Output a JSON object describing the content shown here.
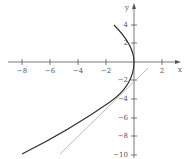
{
  "figure": {
    "x_axis_label": "x",
    "y_axis_label": "y",
    "x_ticks": [
      "−8",
      "−6",
      "−4",
      "−2",
      "2"
    ],
    "y_ticks": [
      "4",
      "2",
      "−2",
      "−4",
      "−6",
      "−8",
      "−10"
    ],
    "curve_color": "#333333",
    "tangent_color": "#aaaaaa"
  }
}
